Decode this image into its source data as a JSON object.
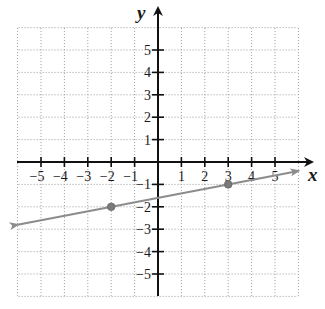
{
  "chart_data": {
    "type": "line",
    "title": "",
    "xlabel": "x",
    "ylabel": "y",
    "xlim": [
      -6,
      6
    ],
    "ylim": [
      -6,
      6
    ],
    "grid": true,
    "grid_style": "dotted",
    "x_ticks": [
      -5,
      -4,
      -3,
      -2,
      -1,
      1,
      2,
      3,
      4,
      5
    ],
    "y_ticks": [
      5,
      4,
      3,
      2,
      1,
      -1,
      -2,
      -3,
      -4,
      -5
    ],
    "x_tick_labels": [
      "−5",
      "−4",
      "−3",
      "−2",
      "−1",
      "1",
      "2",
      "3",
      "4",
      "5"
    ],
    "y_tick_labels": [
      "5",
      "4",
      "3",
      "2",
      "1",
      "−1",
      "−2",
      "−3",
      "−4",
      "−5"
    ],
    "series": [
      {
        "name": "line",
        "kind": "line-with-arrows",
        "equation": "y = x/5 - 8/5",
        "slope": 0.2,
        "intercept": -1.6,
        "x": [
          -6,
          6
        ],
        "y": [
          -2.8,
          -0.4
        ],
        "color": "#8c8c8c",
        "marked_points": [
          {
            "x": -2,
            "y": -2
          },
          {
            "x": 3,
            "y": -1
          }
        ]
      }
    ],
    "legend": null
  },
  "colors": {
    "axis": "#111111",
    "grid": "#9a9a9a",
    "line": "#8c8c8c",
    "point": "#7a7a7a"
  },
  "axes": {
    "x_label": "x",
    "y_label": "y"
  }
}
